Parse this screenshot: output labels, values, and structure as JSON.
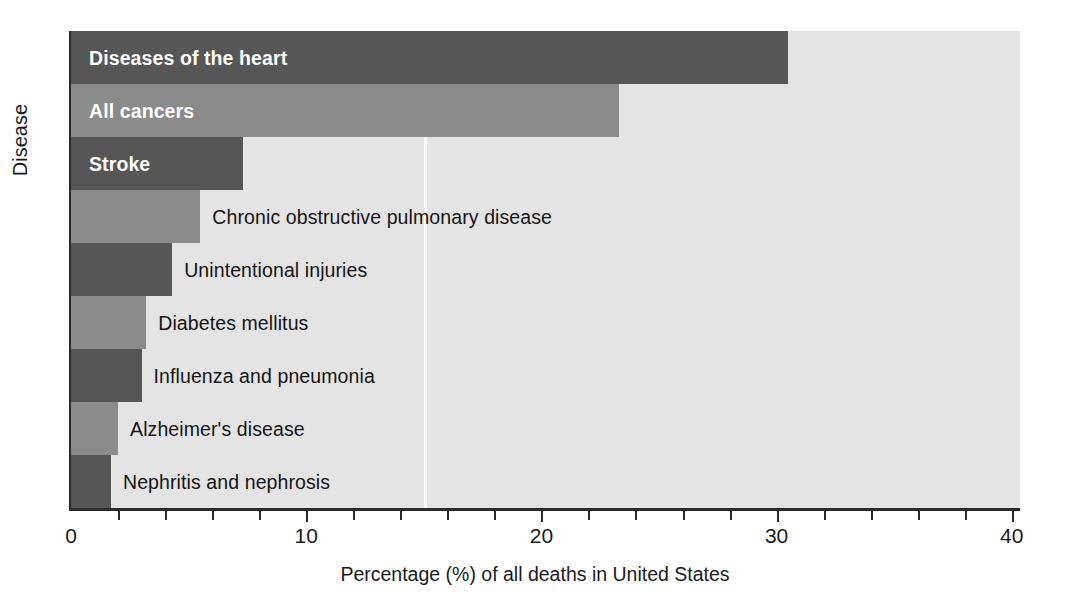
{
  "chart_data": {
    "type": "bar",
    "orientation": "horizontal",
    "title": "",
    "xlabel": "Percentage (%) of all deaths in United States",
    "ylabel": "Disease",
    "xlim": [
      0,
      40
    ],
    "xticks": [
      0,
      10,
      20,
      30,
      40
    ],
    "xtick_labels": [
      "0",
      "10",
      "20",
      "30",
      "40"
    ],
    "minor_tick_interval": 2,
    "grid": true,
    "gridlines": [
      15
    ],
    "legend": "none",
    "categories": [
      "Diseases of the heart",
      "All cancers",
      "Stroke",
      "Chronic obstructive pulmonary disease",
      "Unintentional injuries",
      "Diabetes mellitus",
      "Influenza and pneumonia",
      "Alzheimer's disease",
      "Nephritis and nephrosis"
    ],
    "values": [
      30.5,
      23.3,
      7.3,
      5.5,
      4.3,
      3.2,
      3.0,
      2.0,
      1.7
    ],
    "bars": [
      {
        "label": "Diseases of the heart",
        "value": 30.5,
        "color": "#565656",
        "label_position": "inside"
      },
      {
        "label": "All cancers",
        "value": 23.3,
        "color": "#8b8b8b",
        "label_position": "inside"
      },
      {
        "label": "Stroke",
        "value": 7.3,
        "color": "#565656",
        "label_position": "inside"
      },
      {
        "label": "Chronic obstructive pulmonary disease",
        "value": 5.5,
        "color": "#8b8b8b",
        "label_position": "outside"
      },
      {
        "label": "Unintentional injuries",
        "value": 4.3,
        "color": "#565656",
        "label_position": "outside"
      },
      {
        "label": "Diabetes mellitus",
        "value": 3.2,
        "color": "#8b8b8b",
        "label_position": "outside"
      },
      {
        "label": "Influenza and pneumonia",
        "value": 3.0,
        "color": "#565656",
        "label_position": "outside"
      },
      {
        "label": "Alzheimer's disease",
        "value": 2.0,
        "color": "#8b8b8b",
        "label_position": "outside"
      },
      {
        "label": "Nephritis and nephrosis",
        "value": 1.7,
        "color": "#565656",
        "label_position": "outside"
      }
    ],
    "colors": {
      "dark_bar": "#565656",
      "light_bar": "#8b8b8b",
      "plot_background": "#e4e4e4",
      "figure_background": "#ffffff",
      "axis": "#2a2a2a",
      "gridline": "#fbfbfb",
      "text": "#1b1b1b",
      "inside_label_text": "#ffffff"
    }
  }
}
